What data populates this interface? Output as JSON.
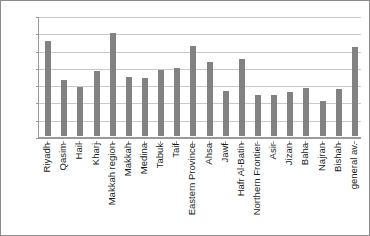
{
  "chart_data": {
    "type": "bar",
    "title": "",
    "subtitle": "",
    "xlabel": "",
    "ylabel": "",
    "ylim": [
      0,
      7000
    ],
    "ytick_step": 1000,
    "ytick_labels": [
      "7,000",
      "6,000",
      "5,000",
      "4,000",
      "3,000",
      "2,000",
      "1,000",
      "0"
    ],
    "ytick_values": [
      7000,
      6000,
      5000,
      4000,
      3000,
      2000,
      1000,
      0
    ],
    "grid": true,
    "legend": null,
    "legend_position": "none",
    "bar_color": "#828282",
    "categories": [
      "Riyadh",
      "Qasim",
      "Hail",
      "Kharj",
      "Makkah region",
      "Makkah",
      "Medina",
      "Tabuk",
      "Taif",
      "Eastern Province",
      "Ahsa",
      "Jawf",
      "Hafr Al-Batin",
      "Northern Frontier",
      "Asir",
      "Jizan",
      "Baha",
      "Najran",
      "Bishah",
      "general av."
    ],
    "values": [
      5500,
      3250,
      2850,
      3780,
      5980,
      3420,
      3350,
      3830,
      3920,
      5200,
      4300,
      2600,
      4450,
      2350,
      2350,
      2550,
      2800,
      2050,
      2700,
      5150
    ]
  },
  "figure": {
    "border_color": "#8c8c8c",
    "background": "#ffffff",
    "grid_color": "#c9c9c9",
    "axis_color": "#9a9a9a"
  }
}
